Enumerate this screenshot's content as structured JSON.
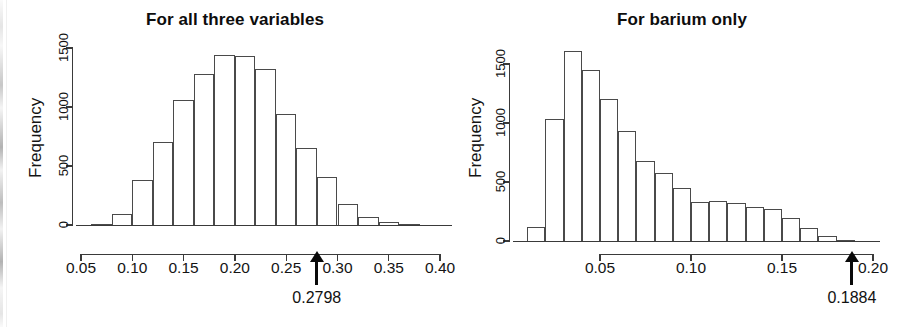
{
  "figure": {
    "kind": "two-panel-histogram-figure",
    "background": "#ffffff",
    "ink_color": "#141414"
  },
  "chart_data": [
    {
      "type": "bar",
      "panel": "left",
      "title": "For all three variables",
      "xlabel": "",
      "ylabel": "Frequency",
      "xlim": [
        0.05,
        0.4
      ],
      "ylim": [
        0,
        1500
      ],
      "grid": false,
      "legend": null,
      "xticks": [
        "0.05",
        "0.10",
        "0.15",
        "0.20",
        "0.25",
        "0.30",
        "0.35",
        "0.40"
      ],
      "xtick_values": [
        0.05,
        0.1,
        0.15,
        0.2,
        0.25,
        0.3,
        0.35,
        0.4
      ],
      "yticks": [
        "0",
        "500",
        "1000",
        "1500"
      ],
      "ytick_values": [
        0,
        500,
        1000,
        1500
      ],
      "bin_width": 0.02,
      "bin_starts": [
        0.06,
        0.08,
        0.1,
        0.12,
        0.14,
        0.16,
        0.18,
        0.2,
        0.22,
        0.24,
        0.26,
        0.28,
        0.3,
        0.32,
        0.34,
        0.36
      ],
      "categories": [
        "0.060-0.080",
        "0.080-0.100",
        "0.100-0.120",
        "0.120-0.140",
        "0.140-0.160",
        "0.160-0.180",
        "0.180-0.200",
        "0.200-0.220",
        "0.220-0.240",
        "0.240-0.260",
        "0.260-0.280",
        "0.280-0.300",
        "0.300-0.320",
        "0.320-0.340",
        "0.340-0.360",
        "0.360-0.380"
      ],
      "values": [
        10,
        90,
        380,
        700,
        1060,
        1280,
        1440,
        1430,
        1320,
        940,
        650,
        410,
        180,
        70,
        25,
        5
      ],
      "annotation": {
        "type": "arrow-marker",
        "label": "0.2798",
        "x_value": 0.2798,
        "direction": "up"
      }
    },
    {
      "type": "bar",
      "panel": "right",
      "title": "For barium only",
      "xlabel": "",
      "ylabel": "Frequency",
      "xlim": [
        0.0,
        0.2
      ],
      "ylim": [
        0,
        1500
      ],
      "grid": false,
      "legend": null,
      "xticks": [
        "0.05",
        "0.10",
        "0.15",
        "0.20"
      ],
      "xtick_values": [
        0.05,
        0.1,
        0.15,
        0.2
      ],
      "yticks": [
        "0",
        "500",
        "1000",
        "1500"
      ],
      "ytick_values": [
        0,
        500,
        1000,
        1500
      ],
      "bin_width": 0.01,
      "bin_starts": [
        0.01,
        0.02,
        0.03,
        0.04,
        0.05,
        0.06,
        0.07,
        0.08,
        0.09,
        0.1,
        0.11,
        0.12,
        0.13,
        0.14,
        0.15,
        0.16,
        0.17,
        0.18
      ],
      "categories": [
        "0.010-0.020",
        "0.020-0.030",
        "0.030-0.040",
        "0.040-0.050",
        "0.050-0.060",
        "0.060-0.070",
        "0.070-0.080",
        "0.080-0.090",
        "0.090-0.100",
        "0.100-0.110",
        "0.110-0.120",
        "0.120-0.130",
        "0.130-0.140",
        "0.140-0.150",
        "0.150-0.160",
        "0.160-0.170",
        "0.170-0.180",
        "0.180-0.190"
      ],
      "values": [
        120,
        1030,
        1610,
        1450,
        1200,
        930,
        680,
        580,
        450,
        330,
        335,
        320,
        285,
        275,
        195,
        110,
        40,
        12
      ],
      "annotation": {
        "type": "arrow-marker",
        "label": "0.1884",
        "x_value": 0.1884,
        "direction": "up"
      }
    }
  ]
}
